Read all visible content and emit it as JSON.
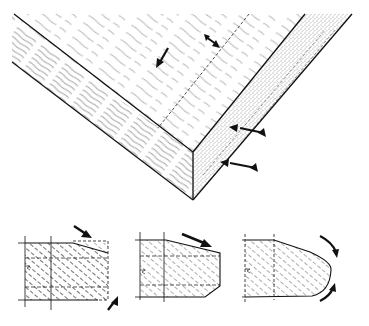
{
  "figure": {
    "colors": {
      "ink": "#111111",
      "grain": "#777777",
      "background": "#ffffff"
    },
    "panel": {
      "top_face": "wood-grain-surface",
      "left_face": "wood-grain-end",
      "right_edge": "stippled-edge-band",
      "arrows_count": 4
    },
    "profiles": [
      {
        "name": "profile-chamfer-top-dashed",
        "arrows": 2
      },
      {
        "name": "profile-chamfer-top-bottom",
        "arrows": 1
      },
      {
        "name": "profile-rounded-nose",
        "arrows": 2
      }
    ]
  }
}
